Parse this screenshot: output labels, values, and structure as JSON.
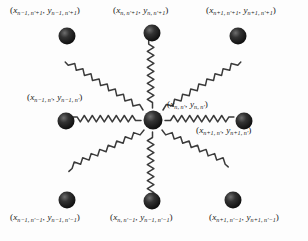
{
  "figure": {
    "node_color": "#1b1b1b",
    "spring_color": "#3a3a3a",
    "background": "#fdfdfd"
  },
  "labels": {
    "top_left": {
      "x_sub": "n−1, n′+1",
      "y_sub": "n−1, n′+1"
    },
    "top_center": {
      "x_sub": "n, n′+1",
      "y_sub": "n, n′+1"
    },
    "top_right": {
      "x_sub": "n+1, n′+1",
      "y_sub": "n+1, n′+1"
    },
    "middle_left": {
      "x_sub": "n−1, n′",
      "y_sub": "n−1, n′"
    },
    "center": {
      "x_sub": "n, n′",
      "y_sub": "n, n′"
    },
    "middle_right": {
      "x_sub": "n+1, n′",
      "y_sub": "n+1, n′"
    },
    "bottom_left": {
      "x_sub": "n−1, n′−1",
      "y_sub": "n−1, n′−1"
    },
    "bottom_center": {
      "x_sub": "n, n′−1",
      "y_sub": "n−1, n′−1"
    },
    "bottom_right": {
      "x_sub": "n+1, n′−1",
      "y_sub": "n+1, n′−1"
    }
  },
  "symbols": {
    "x": "x",
    "y": "y",
    "open_paren": "(",
    "close_paren": ")",
    "comma": ", "
  },
  "nodes": [
    {
      "name": "node-top-left",
      "cx": 67,
      "cy": 36
    },
    {
      "name": "node-top-center",
      "cx": 152,
      "cy": 33
    },
    {
      "name": "node-top-right",
      "cx": 238,
      "cy": 36
    },
    {
      "name": "node-middle-left",
      "cx": 66,
      "cy": 121
    },
    {
      "name": "node-center",
      "cx": 153,
      "cy": 120
    },
    {
      "name": "node-middle-right",
      "cx": 244,
      "cy": 121
    },
    {
      "name": "node-bottom-left",
      "cx": 67,
      "cy": 200
    },
    {
      "name": "node-bottom-center",
      "cx": 152,
      "cy": 201
    },
    {
      "name": "node-bottom-right",
      "cx": 233,
      "cy": 200
    }
  ]
}
